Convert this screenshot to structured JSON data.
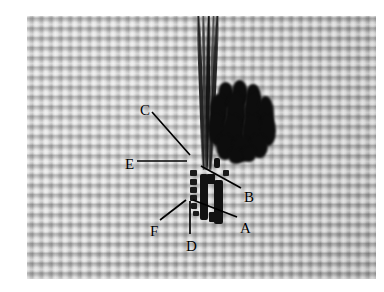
{
  "figure": {
    "kind": "photograph",
    "photo_region": {
      "x": 27,
      "y": 16,
      "width": 349,
      "height": 263
    },
    "background_color": "#bcbcbc",
    "border_color": "#ffffff",
    "ink_color": "#000000"
  },
  "labels": [
    {
      "id": "C",
      "text": "C",
      "x": 140,
      "y": 103,
      "leader": {
        "x1": 152,
        "y1": 112,
        "x2": 190,
        "y2": 155
      }
    },
    {
      "id": "E",
      "text": "E",
      "x": 125,
      "y": 157,
      "leader": {
        "x1": 137,
        "y1": 161,
        "x2": 187,
        "y2": 161
      }
    },
    {
      "id": "B",
      "text": "B",
      "x": 244,
      "y": 190,
      "leader": {
        "x1": 241,
        "y1": 188,
        "x2": 201,
        "y2": 166
      }
    },
    {
      "id": "A",
      "text": "A",
      "x": 240,
      "y": 221,
      "leader": {
        "x1": 237,
        "y1": 217,
        "x2": 193,
        "y2": 200
      }
    },
    {
      "id": "F",
      "text": "F",
      "x": 150,
      "y": 224,
      "leader": {
        "x1": 160,
        "y1": 220,
        "x2": 186,
        "y2": 200
      }
    },
    {
      "id": "D",
      "text": "D",
      "x": 186,
      "y": 239,
      "leader": {
        "x1": 190,
        "y1": 234,
        "x2": 190,
        "y2": 201
      }
    }
  ],
  "thread": {
    "name": "suture-thread",
    "color": "#141414",
    "strands": [
      {
        "left": 4,
        "width": 4.0,
        "color": "#1c1c1c",
        "rotate": -2.0,
        "opacity": 0.95
      },
      {
        "left": 8,
        "width": 3.2,
        "color": "#2a2a2a",
        "rotate": -1.0,
        "opacity": 0.85
      },
      {
        "left": 11,
        "width": 4.4,
        "color": "#101010",
        "rotate": 0.6,
        "opacity": 0.97
      },
      {
        "left": 15,
        "width": 3.0,
        "color": "#333333",
        "rotate": 1.6,
        "opacity": 0.8
      },
      {
        "left": 17,
        "width": 3.6,
        "color": "#1a1a1a",
        "rotate": 2.6,
        "opacity": 0.92
      }
    ]
  },
  "knot": {
    "name": "knot-bundle",
    "color": "#0d0d0d",
    "lobes": [
      {
        "x": 10,
        "y": 2,
        "w": 16,
        "h": 26
      },
      {
        "x": 24,
        "y": 0,
        "w": 16,
        "h": 28
      },
      {
        "x": 38,
        "y": 4,
        "w": 15,
        "h": 24
      },
      {
        "x": 2,
        "y": 14,
        "w": 18,
        "h": 34
      },
      {
        "x": 18,
        "y": 12,
        "w": 20,
        "h": 44
      },
      {
        "x": 36,
        "y": 12,
        "w": 20,
        "h": 42
      },
      {
        "x": 50,
        "y": 16,
        "w": 16,
        "h": 34
      },
      {
        "x": 0,
        "y": 32,
        "w": 18,
        "h": 34
      },
      {
        "x": 14,
        "y": 34,
        "w": 22,
        "h": 40
      },
      {
        "x": 34,
        "y": 34,
        "w": 22,
        "h": 40
      },
      {
        "x": 52,
        "y": 34,
        "w": 16,
        "h": 32
      },
      {
        "x": 8,
        "y": 54,
        "w": 18,
        "h": 26
      },
      {
        "x": 24,
        "y": 56,
        "w": 20,
        "h": 26
      },
      {
        "x": 42,
        "y": 54,
        "w": 18,
        "h": 24
      },
      {
        "x": 20,
        "y": 68,
        "w": 16,
        "h": 16
      },
      {
        "x": 34,
        "y": 66,
        "w": 14,
        "h": 16
      }
    ]
  },
  "clip": {
    "name": "surgical-clip",
    "color": "#121212",
    "bars": [
      {
        "x": 23,
        "y": 18,
        "w": 8,
        "h": 46,
        "radius": "2px"
      },
      {
        "x": 37,
        "y": 24,
        "w": 9,
        "h": 44,
        "radius": "2px"
      },
      {
        "x": 30,
        "y": 18,
        "w": 8,
        "h": 10,
        "radius": "1px"
      },
      {
        "x": 32,
        "y": 56,
        "w": 10,
        "h": 10,
        "radius": "1px"
      },
      {
        "x": 37,
        "y": 2,
        "w": 6,
        "h": 10,
        "radius": "2px"
      }
    ],
    "dots": [
      {
        "x": 13,
        "y": 14,
        "w": 7,
        "h": 6
      },
      {
        "x": 13,
        "y": 23,
        "w": 7,
        "h": 6
      },
      {
        "x": 13,
        "y": 31,
        "w": 7,
        "h": 6
      },
      {
        "x": 13,
        "y": 39,
        "w": 7,
        "h": 6
      },
      {
        "x": 14,
        "y": 47,
        "w": 6,
        "h": 6
      },
      {
        "x": 16,
        "y": 55,
        "w": 6,
        "h": 5
      },
      {
        "x": 46,
        "y": 14,
        "w": 6,
        "h": 6
      }
    ]
  }
}
